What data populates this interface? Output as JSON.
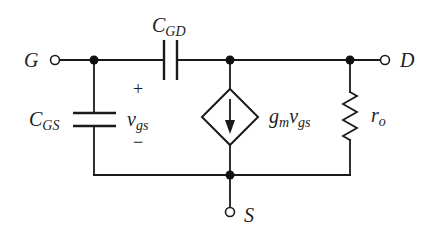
{
  "diagram": {
    "colors": {
      "line": "#1a1a1a",
      "background": "#ffffff",
      "text": "#222222"
    },
    "terminals": {
      "gate": {
        "label": "G"
      },
      "drain": {
        "label": "D"
      },
      "source": {
        "label": "S"
      }
    },
    "components": {
      "cgd": {
        "main": "C",
        "sub": "GD"
      },
      "cgs": {
        "main": "C",
        "sub": "GS"
      },
      "vgs": {
        "main": "v",
        "sub": "gs",
        "plus": "+",
        "minus": "−"
      },
      "current_source": {
        "gm": "g",
        "gm_sub": "m",
        "v": "v",
        "v_sub": "gs"
      },
      "ro": {
        "main": "r",
        "sub": "o"
      }
    }
  }
}
